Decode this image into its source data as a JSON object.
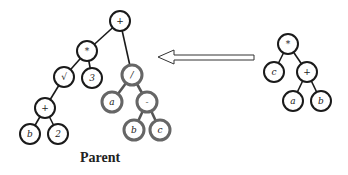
{
  "caption": "Parent",
  "left_tree": {
    "name": "parent-tree",
    "nodes": [
      {
        "id": "p1",
        "label": "+",
        "x": 120,
        "y": 21,
        "group": "black"
      },
      {
        "id": "p2",
        "label": "*",
        "x": 87,
        "y": 51,
        "group": "black"
      },
      {
        "id": "p3",
        "label": "√",
        "x": 64,
        "y": 77,
        "group": "black"
      },
      {
        "id": "p4",
        "label": "3",
        "x": 92,
        "y": 78,
        "group": "black"
      },
      {
        "id": "p5",
        "label": "+",
        "x": 45,
        "y": 108,
        "group": "black"
      },
      {
        "id": "p6",
        "label": "b",
        "x": 30,
        "y": 134,
        "group": "black"
      },
      {
        "id": "p7",
        "label": "2",
        "x": 58,
        "y": 134,
        "group": "black"
      },
      {
        "id": "p8",
        "label": "/",
        "x": 132,
        "y": 75,
        "group": "gray"
      },
      {
        "id": "p9",
        "label": "a",
        "x": 112,
        "y": 102,
        "group": "gray"
      },
      {
        "id": "p10",
        "label": "-",
        "x": 147,
        "y": 102,
        "group": "gray"
      },
      {
        "id": "p11",
        "label": "b",
        "x": 134,
        "y": 130,
        "group": "gray"
      },
      {
        "id": "p12",
        "label": "c",
        "x": 160,
        "y": 130,
        "group": "gray"
      }
    ],
    "edges": [
      [
        "p1",
        "p2",
        "black"
      ],
      [
        "p1",
        "p8",
        "black"
      ],
      [
        "p2",
        "p3",
        "black"
      ],
      [
        "p2",
        "p4",
        "black"
      ],
      [
        "p3",
        "p5",
        "black"
      ],
      [
        "p5",
        "p6",
        "black"
      ],
      [
        "p5",
        "p7",
        "black"
      ],
      [
        "p8",
        "p9",
        "gray"
      ],
      [
        "p8",
        "p10",
        "gray"
      ],
      [
        "p10",
        "p11",
        "gray"
      ],
      [
        "p10",
        "p12",
        "gray"
      ]
    ]
  },
  "right_tree": {
    "name": "subtree",
    "nodes": [
      {
        "id": "s1",
        "label": "*",
        "x": 288,
        "y": 44,
        "group": "black"
      },
      {
        "id": "s2",
        "label": "c",
        "x": 274,
        "y": 72,
        "group": "black"
      },
      {
        "id": "s3",
        "label": "+",
        "x": 307,
        "y": 72,
        "group": "black"
      },
      {
        "id": "s4",
        "label": "a",
        "x": 293,
        "y": 101,
        "group": "black"
      },
      {
        "id": "s5",
        "label": "b",
        "x": 321,
        "y": 101,
        "group": "black"
      }
    ],
    "edges": [
      [
        "s1",
        "s2",
        "black"
      ],
      [
        "s1",
        "s3",
        "black"
      ],
      [
        "s3",
        "s4",
        "black"
      ],
      [
        "s3",
        "s5",
        "black"
      ]
    ]
  },
  "arrow": {
    "direction": "left",
    "from_x": 254,
    "to_x": 158,
    "y": 57
  }
}
